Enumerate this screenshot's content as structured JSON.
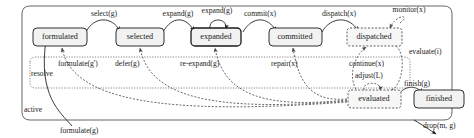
{
  "diagram": {
    "outer_region": {
      "label": "active",
      "border_style": "solid-rounded"
    },
    "inner_region": {
      "label": "resolve",
      "border_style": "dotted-rounded"
    },
    "states": [
      {
        "id": "formulated",
        "label": "formulated",
        "border": "solid",
        "x": 60,
        "y": 37
      },
      {
        "id": "selected",
        "label": "selected",
        "border": "solid",
        "x": 140,
        "y": 37
      },
      {
        "id": "expanded",
        "label": "expanded",
        "border": "solid",
        "x": 216,
        "y": 37
      },
      {
        "id": "committed",
        "label": "committed",
        "border": "solid",
        "x": 295,
        "y": 37
      },
      {
        "id": "dispatched",
        "label": "dispatched",
        "border": "dashed",
        "x": 374,
        "y": 37
      },
      {
        "id": "evaluated",
        "label": "evaluated",
        "border": "dashed",
        "x": 374,
        "y": 99
      },
      {
        "id": "finished",
        "label": "finished",
        "border": "solid",
        "x": 440,
        "y": 99
      }
    ],
    "transitions": [
      {
        "id": "select",
        "label": "select(g)",
        "from": "formulated",
        "to": "selected",
        "style": "solid"
      },
      {
        "id": "expand",
        "label": "expand(g)",
        "from": "selected",
        "to": "expanded",
        "style": "solid"
      },
      {
        "id": "expand-self",
        "label": "expand(g)",
        "from": "expanded",
        "to": "expanded",
        "style": "solid"
      },
      {
        "id": "commit",
        "label": "commit(x)",
        "from": "expanded",
        "to": "committed",
        "style": "solid"
      },
      {
        "id": "dispatch",
        "label": "dispatch(x)",
        "from": "committed",
        "to": "dispatched",
        "style": "solid"
      },
      {
        "id": "monitor",
        "label": "monitor(x)",
        "from": "dispatched",
        "to": "dispatched",
        "style": "dashed"
      },
      {
        "id": "evaluate",
        "label": "evaluate(i)",
        "from": "dispatched",
        "to": "evaluated",
        "style": "dashed"
      },
      {
        "id": "continue",
        "label": "continue(x)",
        "from": "evaluated",
        "to": "dispatched",
        "style": "dashed"
      },
      {
        "id": "adjust",
        "label": "adjust(L)",
        "from": "evaluated",
        "to": "evaluated",
        "style": "dashed"
      },
      {
        "id": "repair",
        "label": "repair(x)",
        "from": "evaluated",
        "to": "committed",
        "style": "dashed"
      },
      {
        "id": "re-expand",
        "label": "re-expand(g)",
        "from": "evaluated",
        "to": "expanded",
        "style": "dashed"
      },
      {
        "id": "defer",
        "label": "defer(g)",
        "from": "evaluated",
        "to": "selected",
        "style": "dashed"
      },
      {
        "id": "reformulate",
        "label": "formulate(g')",
        "from": "evaluated",
        "to": "formulated",
        "style": "dashed"
      },
      {
        "id": "finish",
        "label": "finish(g)",
        "from": "evaluated",
        "to": "finished",
        "style": "solid"
      },
      {
        "id": "create",
        "label": "formulate(g)",
        "from": "start",
        "to": "formulated",
        "style": "solid"
      },
      {
        "id": "drop",
        "label": "drop(m, g)",
        "from": "active",
        "to": "end",
        "style": "solid"
      }
    ]
  }
}
